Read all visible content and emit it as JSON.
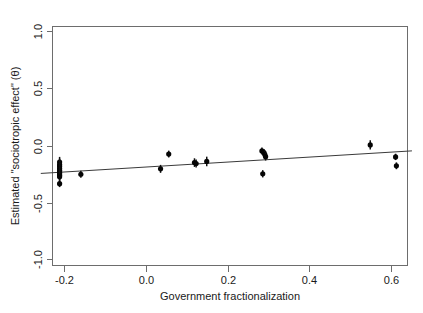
{
  "chart_data": {
    "type": "scatter",
    "title": "",
    "xlabel": "Government fractionalization",
    "ylabel": "Estimated \"sociotropic effect\" (θ)",
    "xlim": [
      -0.26,
      0.655
    ],
    "ylim": [
      -1.12,
      1.1
    ],
    "xticks": [
      -0.2,
      0.0,
      0.2,
      0.4,
      0.6
    ],
    "xticklabels": [
      "-0.2",
      "0.0",
      "0.2",
      "0.4",
      "0.6"
    ],
    "yticks": [
      1.0,
      0.5,
      0.0,
      -0.5,
      -1.0
    ],
    "yticklabels": [
      "1.0",
      "0.5",
      "0.0",
      "-0.5",
      "-1.0"
    ],
    "grid": false,
    "legend": null,
    "error_bars": "vertical",
    "points": [
      {
        "x": -0.212,
        "y": -0.145,
        "yerr": 0.045
      },
      {
        "x": -0.212,
        "y": -0.168,
        "yerr": 0.052
      },
      {
        "x": -0.212,
        "y": -0.185,
        "yerr": 0.048
      },
      {
        "x": -0.212,
        "y": -0.202,
        "yerr": 0.05
      },
      {
        "x": -0.212,
        "y": -0.218,
        "yerr": 0.046
      },
      {
        "x": -0.212,
        "y": -0.232,
        "yerr": 0.044
      },
      {
        "x": -0.212,
        "y": -0.248,
        "yerr": 0.047
      },
      {
        "x": -0.212,
        "y": -0.262,
        "yerr": 0.043
      },
      {
        "x": -0.212,
        "y": -0.275,
        "yerr": 0.04
      },
      {
        "x": -0.212,
        "y": -0.335,
        "yerr": 0.03
      },
      {
        "x": -0.16,
        "y": -0.252,
        "yerr": 0.03
      },
      {
        "x": 0.035,
        "y": -0.205,
        "yerr": 0.035
      },
      {
        "x": 0.055,
        "y": -0.075,
        "yerr": 0.03
      },
      {
        "x": 0.118,
        "y": -0.15,
        "yerr": 0.038
      },
      {
        "x": 0.122,
        "y": -0.158,
        "yerr": 0.035
      },
      {
        "x": 0.148,
        "y": -0.14,
        "yerr": 0.042
      },
      {
        "x": 0.283,
        "y": -0.048,
        "yerr": 0.03
      },
      {
        "x": 0.288,
        "y": -0.062,
        "yerr": 0.032
      },
      {
        "x": 0.29,
        "y": -0.08,
        "yerr": 0.035
      },
      {
        "x": 0.292,
        "y": -0.098,
        "yerr": 0.034
      },
      {
        "x": 0.285,
        "y": -0.248,
        "yerr": 0.032
      },
      {
        "x": 0.548,
        "y": 0.005,
        "yerr": 0.04
      },
      {
        "x": 0.61,
        "y": -0.1,
        "yerr": 0.028
      },
      {
        "x": 0.612,
        "y": -0.178,
        "yerr": 0.03
      }
    ],
    "fit_line": {
      "x_start": -0.258,
      "y_start": -0.245,
      "x_end": 0.65,
      "y_end": -0.047
    }
  }
}
